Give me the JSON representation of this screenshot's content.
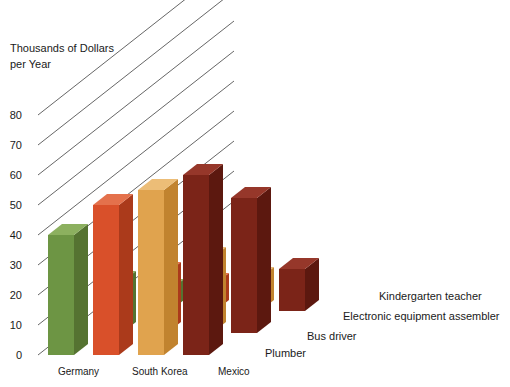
{
  "chart_data": {
    "type": "bar",
    "title": "",
    "subtitle": "",
    "ylabel_line1": "Thousands of Dollars",
    "ylabel_line2": "per Year",
    "xlabel": "",
    "ylim": [
      0,
      80
    ],
    "yticks": [
      0,
      10,
      20,
      30,
      40,
      50,
      60,
      70,
      80
    ],
    "ytick_labels": [
      "0",
      "10",
      "20",
      "30",
      "40",
      "50",
      "60",
      "70",
      "80"
    ],
    "grid": true,
    "legend_position": "inline-right",
    "projection": "3d-isometric",
    "categories": [
      "Germany",
      "South Korea",
      "Mexico"
    ],
    "series": [
      {
        "name": "Plumber",
        "color": "#6d9544",
        "color_top": "#8cb05f",
        "color_side": "#557331",
        "values": [
          40,
          17,
          7
        ]
      },
      {
        "name": "Bus driver",
        "color": "#d9502a",
        "color_top": "#e4714c",
        "color_side": "#ab3a1b",
        "values": [
          50,
          20,
          9
        ]
      },
      {
        "name": "Electronic equipment assembler",
        "color": "#e0a34e",
        "color_top": "#ecbd77",
        "color_side": "#c1832f",
        "values": [
          55,
          25,
          11
        ]
      },
      {
        "name": "Kindergarten teacher",
        "color": "#7b2418",
        "color_top": "#96372a",
        "color_side": "#5c180f",
        "values": [
          60,
          45,
          14
        ]
      }
    ]
  }
}
